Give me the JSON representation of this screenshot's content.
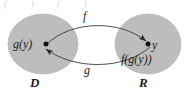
{
  "figure": {
    "title_partial_cut_off": "( )       ( )",
    "background_color": "#ffffff",
    "set_fill_color": "#bdbdbd",
    "stroke_color": "#3a3a3a",
    "text_color": "#1c1c1c",
    "sets": [
      {
        "name": "domain",
        "label": "D",
        "point_label": "g(y)",
        "cx": 43,
        "cy": 44,
        "rx": 35,
        "ry": 30
      },
      {
        "name": "range",
        "label": "R",
        "point_label": "y",
        "secondary_label": "f(g(y))",
        "cx": 148,
        "cy": 44,
        "rx": 33,
        "ry": 30
      }
    ],
    "arrows": [
      {
        "name": "f-arrow",
        "label": "f",
        "from": "g(y)",
        "to": "y",
        "direction": "left-to-right"
      },
      {
        "name": "g-arrow",
        "label": "g",
        "from": "y",
        "to": "g(y)",
        "direction": "right-to-left"
      }
    ]
  }
}
